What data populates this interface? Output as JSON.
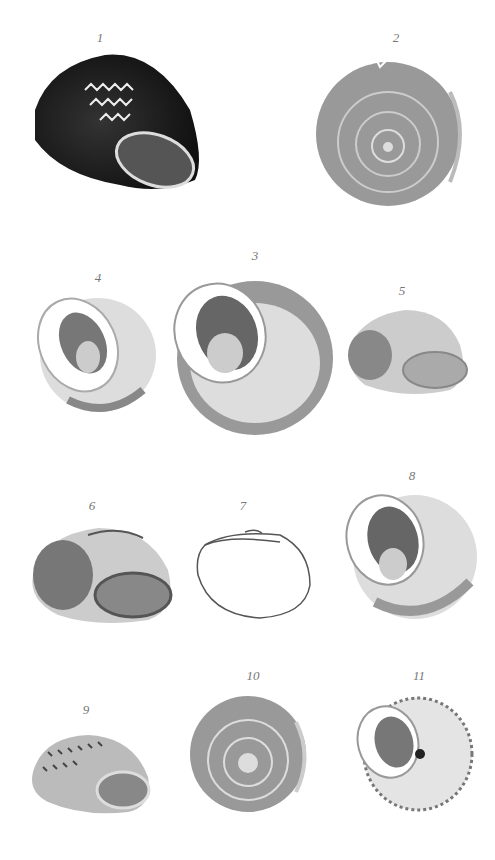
{
  "plate": {
    "figures": [
      {
        "number": "1",
        "view": "side aperture view, dark zigzag banded shell"
      },
      {
        "number": "2",
        "view": "apical view, mottled shell"
      },
      {
        "number": "3",
        "view": "umbilical aperture view, large shell"
      },
      {
        "number": "4",
        "view": "umbilical aperture view, pale shell"
      },
      {
        "number": "5",
        "view": "side aperture view, small pale shell"
      },
      {
        "number": "6",
        "view": "side aperture view"
      },
      {
        "number": "7",
        "view": "outline drawing"
      },
      {
        "number": "8",
        "view": "umbilical aperture view"
      },
      {
        "number": "9",
        "view": "side aperture view, speckled shell"
      },
      {
        "number": "10",
        "view": "apical view, speckled shell"
      },
      {
        "number": "11",
        "view": "umbilical aperture view with beaded keel"
      }
    ]
  },
  "colors": {
    "ink": "#222222",
    "mid": "#777777",
    "light": "#bbbbbb",
    "paper": "#ffffff"
  }
}
